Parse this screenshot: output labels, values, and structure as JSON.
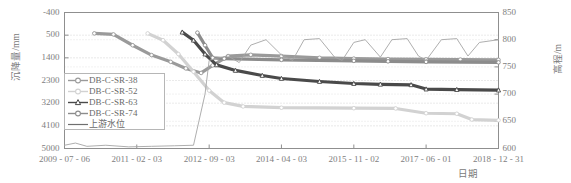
{
  "chart_data": {
    "type": "line",
    "title": "",
    "xlabel": "日期",
    "ylabel": "沉降量/mm",
    "ylabel_right": "高程/m",
    "grid": true,
    "legend_position": "center-left-inside",
    "x_ticks": [
      "2009-07-06",
      "2011-02-03",
      "2012-09-03",
      "2014-04-03",
      "2015-11-02",
      "2017-06-01",
      "2018-12-31"
    ],
    "y_ticks_left": [
      -400,
      500,
      1400,
      2300,
      3200,
      4100,
      5000
    ],
    "y_ticks_right": [
      850,
      800,
      750,
      700,
      650,
      600
    ],
    "ylim_left": [
      5000,
      -400
    ],
    "ylim_right": [
      600,
      850
    ],
    "x_range": [
      "2009-07-06",
      "2018-12-31"
    ],
    "series": [
      {
        "name": "DB-C-SR-38",
        "color": "#9a9a9a",
        "axis": "left",
        "marker": "circle",
        "points": [
          [
            "2010-03-01",
            430
          ],
          [
            "2010-08-01",
            470
          ],
          [
            "2011-01-01",
            900
          ],
          [
            "2011-06-01",
            1290
          ],
          [
            "2011-11-01",
            1560
          ],
          [
            "2012-03-01",
            1820
          ],
          [
            "2012-07-01",
            2000
          ],
          [
            "2012-10-01",
            1700
          ],
          [
            "2013-02-01",
            1330
          ],
          [
            "2013-08-01",
            1280
          ],
          [
            "2014-04-03",
            1330
          ],
          [
            "2015-02-01",
            1400
          ],
          [
            "2015-11-02",
            1430
          ],
          [
            "2016-08-01",
            1450
          ],
          [
            "2017-06-01",
            1460
          ],
          [
            "2018-03-01",
            1470
          ],
          [
            "2018-12-31",
            1480
          ]
        ]
      },
      {
        "name": "DB-C-SR-52",
        "color": "#d2d2d2",
        "axis": "left",
        "marker": "circle",
        "points": [
          [
            "2011-05-01",
            430
          ],
          [
            "2011-09-01",
            700
          ],
          [
            "2012-01-01",
            1250
          ],
          [
            "2012-05-01",
            1950
          ],
          [
            "2012-09-03",
            2700
          ],
          [
            "2013-01-01",
            3180
          ],
          [
            "2013-06-01",
            3330
          ],
          [
            "2014-04-03",
            3380
          ],
          [
            "2015-11-02",
            3400
          ],
          [
            "2016-10-01",
            3410
          ],
          [
            "2017-06-01",
            3600
          ],
          [
            "2018-02-01",
            3620
          ],
          [
            "2018-06-01",
            3850
          ],
          [
            "2018-12-31",
            3880
          ]
        ]
      },
      {
        "name": "DB-C-SR-63",
        "color": "#4a4a4a",
        "axis": "left",
        "marker": "triangle",
        "points": [
          [
            "2012-02-01",
            380
          ],
          [
            "2012-05-01",
            700
          ],
          [
            "2012-08-01",
            1250
          ],
          [
            "2012-11-01",
            1680
          ],
          [
            "2013-04-01",
            1900
          ],
          [
            "2013-11-01",
            2100
          ],
          [
            "2014-04-03",
            2220
          ],
          [
            "2015-02-01",
            2340
          ],
          [
            "2015-11-02",
            2420
          ],
          [
            "2016-06-01",
            2450
          ],
          [
            "2017-02-01",
            2470
          ],
          [
            "2017-06-01",
            2640
          ],
          [
            "2018-02-01",
            2660
          ],
          [
            "2018-12-31",
            2680
          ]
        ]
      },
      {
        "name": "DB-C-SR-74",
        "color": "#8c8c8c",
        "axis": "left",
        "marker": "circle",
        "points": [
          [
            "2012-06-01",
            400
          ],
          [
            "2012-08-01",
            900
          ],
          [
            "2012-10-01",
            1400
          ],
          [
            "2013-01-01",
            1430
          ],
          [
            "2014-04-03",
            1480
          ],
          [
            "2015-11-02",
            1520
          ],
          [
            "2016-08-01",
            1540
          ],
          [
            "2017-06-01",
            1560
          ],
          [
            "2018-12-31",
            1580
          ]
        ]
      },
      {
        "name": "上游水位",
        "color": "#a5a5a5",
        "axis": "right",
        "marker": "none",
        "points": [
          [
            "2009-07-06",
            606
          ],
          [
            "2009-10-01",
            610
          ],
          [
            "2010-01-01",
            604
          ],
          [
            "2010-06-01",
            606
          ],
          [
            "2010-12-01",
            603
          ],
          [
            "2011-06-01",
            604
          ],
          [
            "2011-12-01",
            605
          ],
          [
            "2012-05-01",
            606
          ],
          [
            "2012-08-01",
            700
          ],
          [
            "2012-09-03",
            762
          ],
          [
            "2012-11-01",
            766
          ],
          [
            "2013-02-01",
            770
          ],
          [
            "2013-05-01",
            758
          ],
          [
            "2013-08-01",
            790
          ],
          [
            "2013-12-01",
            800
          ],
          [
            "2014-04-03",
            772
          ],
          [
            "2014-07-01",
            762
          ],
          [
            "2014-10-01",
            800
          ],
          [
            "2015-02-01",
            802
          ],
          [
            "2015-06-01",
            768
          ],
          [
            "2015-08-01",
            762
          ],
          [
            "2015-11-02",
            795
          ],
          [
            "2016-02-01",
            800
          ],
          [
            "2016-06-01",
            768
          ],
          [
            "2016-09-01",
            800
          ],
          [
            "2017-01-01",
            802
          ],
          [
            "2017-04-01",
            770
          ],
          [
            "2017-06-01",
            762
          ],
          [
            "2017-10-01",
            800
          ],
          [
            "2018-02-01",
            802
          ],
          [
            "2018-05-01",
            770
          ],
          [
            "2018-08-01",
            795
          ],
          [
            "2018-12-31",
            800
          ]
        ]
      }
    ]
  }
}
